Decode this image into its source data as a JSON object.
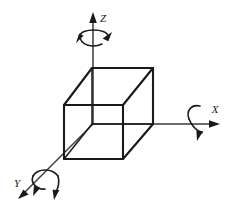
{
  "figure": {
    "background_color": "#ffffff",
    "line_color": "#1a1a1a",
    "axis_color": "#3a3a3a",
    "width": 230,
    "height": 209
  },
  "axes": [
    {
      "id": "z",
      "label": "Z",
      "direction": "up",
      "label_x": 103,
      "label_y": 19,
      "rotation_icon": "rotation-arrow-z",
      "rotation_sense": "counterclockwise-about-z"
    },
    {
      "id": "x",
      "label": "X",
      "direction": "right",
      "label_x": 215,
      "label_y": 110,
      "rotation_icon": "rotation-arrow-x",
      "rotation_sense": "clockwise-about-x"
    },
    {
      "id": "y",
      "label": "Y",
      "direction": "down-left",
      "label_x": 17,
      "label_y": 184,
      "rotation_icon": "rotation-arrow-y",
      "rotation_sense": "clockwise-about-y"
    }
  ],
  "cube": {
    "name": "wireframe-cube",
    "vertices": {
      "front_top_left": [
        64,
        105
      ],
      "front_top_right": [
        123,
        105
      ],
      "front_bottom_left": [
        64,
        159
      ],
      "front_bottom_right": [
        123,
        159
      ],
      "back_top_left": [
        92,
        68
      ],
      "back_top_right": [
        153,
        68
      ],
      "back_bottom_left": [
        92,
        124
      ],
      "back_bottom_right": [
        153,
        124
      ]
    },
    "edges_visible": 9,
    "edges_hidden": 3
  }
}
